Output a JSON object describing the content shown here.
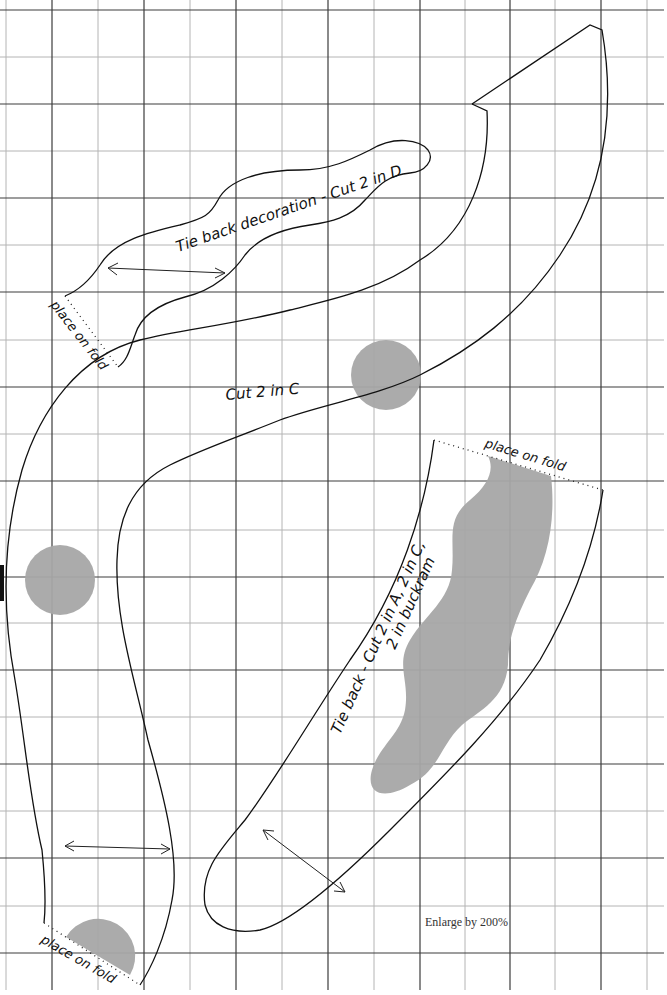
{
  "pattern_sheet": {
    "grid": {
      "major_color": "#3c3c3c",
      "minor_color": "#b4b4b4",
      "cell_px": 46.5
    },
    "shading_color": "#a6a6a6",
    "pieces": [
      {
        "id": "tie-back-decoration",
        "label": "Tie back decoration - Cut 2 in D",
        "fold_label": "place on fold"
      },
      {
        "id": "main-piece",
        "label": "Cut 2 in C",
        "fold_label": "place on fold"
      },
      {
        "id": "tie-back",
        "label_line1": "Tie back - Cut 2 in A, 2 in C,",
        "label_line2": "2 in buckram",
        "fold_label": "place on fold"
      }
    ],
    "instruction": "Enlarge by 200%"
  }
}
